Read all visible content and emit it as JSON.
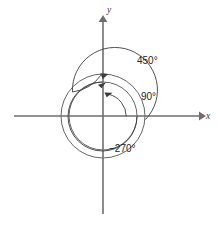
{
  "figure": {
    "background_color": "#ffffff",
    "line_color": "#4a4a4a",
    "axis_color": "#6e6e6e",
    "text_color": "#262626",
    "axes": {
      "x_label": "x",
      "y_label": "y",
      "origin_x": 103,
      "origin_y": 116,
      "x_start": 14,
      "x_end": 203,
      "y_start": 18,
      "y_end": 214
    },
    "circles": [
      {
        "name": "outer-circle",
        "radius": 42
      },
      {
        "name": "middle-circle",
        "radius": 34
      }
    ],
    "angles": [
      {
        "name": "angle-450",
        "label": "450°",
        "degrees": 450,
        "direction": "counterclockwise",
        "radius": 42,
        "label_x": 137,
        "label_y": 61,
        "arrow": "left"
      },
      {
        "name": "angle-90",
        "label": "90°",
        "degrees": 90,
        "direction": "counterclockwise",
        "radius": 23,
        "label_x": 140,
        "label_y": 97,
        "arrow": "left"
      },
      {
        "name": "angle-minus-270",
        "label": "−270°",
        "degrees": -270,
        "direction": "clockwise",
        "radius": 34,
        "label_x": 119,
        "label_y": 148,
        "arrow": "right"
      }
    ]
  }
}
